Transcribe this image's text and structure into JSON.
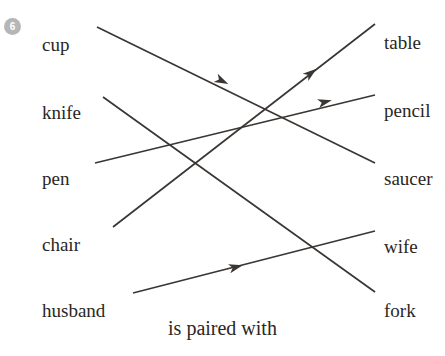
{
  "exercise": {
    "number": "6",
    "caption": "is paired with"
  },
  "left_column": [
    {
      "label": "cup",
      "x": 42,
      "y": 35
    },
    {
      "label": "knife",
      "x": 42,
      "y": 103
    },
    {
      "label": "pen",
      "x": 42,
      "y": 169
    },
    {
      "label": "chair",
      "x": 42,
      "y": 235
    },
    {
      "label": "husband",
      "x": 42,
      "y": 301
    }
  ],
  "right_column": [
    {
      "label": "table",
      "x": 384,
      "y": 33
    },
    {
      "label": "pencil",
      "x": 384,
      "y": 101
    },
    {
      "label": "saucer",
      "x": 384,
      "y": 169
    },
    {
      "label": "wife",
      "x": 384,
      "y": 237
    },
    {
      "label": "fork",
      "x": 384,
      "y": 301
    }
  ],
  "pairs": [
    {
      "from": "cup",
      "to": "saucer",
      "x1": 97,
      "y1": 27,
      "x2": 375,
      "y2": 163,
      "ax": 222,
      "ay": 81
    },
    {
      "from": "knife",
      "to": "fork",
      "x1": 103,
      "y1": 97,
      "x2": 375,
      "y2": 292,
      "ax": 0,
      "ay": 0
    },
    {
      "from": "pen",
      "to": "pencil",
      "x1": 95,
      "y1": 163,
      "x2": 375,
      "y2": 95,
      "ax": 325,
      "ay": 102
    },
    {
      "from": "chair",
      "to": "table",
      "x1": 113,
      "y1": 227,
      "x2": 375,
      "y2": 24,
      "ax": 311,
      "ay": 73
    },
    {
      "from": "husband",
      "to": "wife",
      "x1": 133,
      "y1": 293,
      "x2": 375,
      "y2": 231,
      "ax": 236,
      "ay": 267
    }
  ],
  "colors": {
    "ink": "#2a2624",
    "line": "#3a3634",
    "badge": "#b6b6b6",
    "background": "#ffffff"
  }
}
